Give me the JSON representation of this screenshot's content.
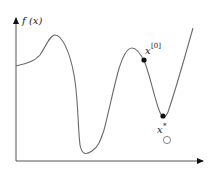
{
  "diagram": {
    "type": "function-plot",
    "y_axis_label": "f (x)",
    "start_point_label": "x",
    "start_point_superscript": "[0]",
    "minimum_label": "x",
    "minimum_superscript": "*",
    "colors": {
      "curve": "#6a6a6a",
      "axis": "#444444",
      "point": "#111111",
      "text": "#222222"
    }
  }
}
